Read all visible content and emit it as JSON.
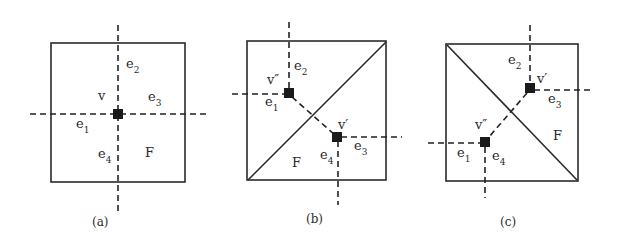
{
  "figure": {
    "panels": [
      {
        "id": "a",
        "caption": "(a)",
        "face_label": "F",
        "vertices": [
          {
            "name": "v",
            "label": "v"
          }
        ],
        "edges": [
          {
            "base": "e",
            "sub": "1"
          },
          {
            "base": "e",
            "sub": "2"
          },
          {
            "base": "e",
            "sub": "3"
          },
          {
            "base": "e",
            "sub": "4"
          }
        ],
        "diagonal": "none"
      },
      {
        "id": "b",
        "caption": "(b)",
        "face_label": "F",
        "vertices": [
          {
            "name": "v-double-prime",
            "label": "v″"
          },
          {
            "name": "v-prime",
            "label": "v′"
          }
        ],
        "edges": [
          {
            "base": "e",
            "sub": "1"
          },
          {
            "base": "e",
            "sub": "2"
          },
          {
            "base": "e",
            "sub": "3"
          },
          {
            "base": "e",
            "sub": "4"
          }
        ],
        "diagonal": "bottom-left to top-right"
      },
      {
        "id": "c",
        "caption": "(c)",
        "face_label": "F",
        "vertices": [
          {
            "name": "v-prime",
            "label": "v′"
          },
          {
            "name": "v-double-prime",
            "label": "v″"
          }
        ],
        "edges": [
          {
            "base": "e",
            "sub": "1"
          },
          {
            "base": "e",
            "sub": "2"
          },
          {
            "base": "e",
            "sub": "3"
          },
          {
            "base": "e",
            "sub": "4"
          }
        ],
        "diagonal": "top-left to bottom-right"
      }
    ]
  }
}
